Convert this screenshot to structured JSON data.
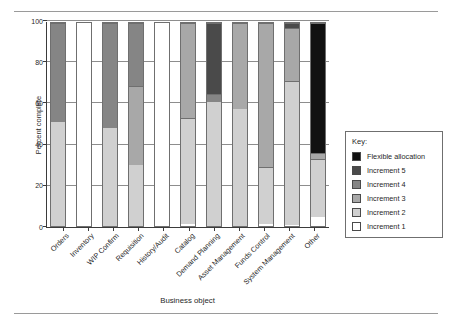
{
  "figure": {
    "top_rule": "",
    "bottom_rule": ""
  },
  "chart_data": {
    "type": "bar",
    "stacked": true,
    "title": "",
    "xlabel": "Business object",
    "ylabel": "Percent complete",
    "ylim": [
      0,
      100
    ],
    "yticks": [
      0,
      20,
      40,
      60,
      80,
      100
    ],
    "grid": true,
    "legend_position": "right",
    "legend_title": "Key:",
    "categories": [
      "Orders",
      "Inventory",
      "WIP Confirm",
      "Requisition",
      "History/Audit",
      "Catalog",
      "Demand Planning",
      "Asset Management",
      "Funds Control",
      "System Management",
      "Other"
    ],
    "series": [
      {
        "name": "Increment 1",
        "color": "#ffffff",
        "values": [
          0,
          100,
          0,
          0,
          100,
          1,
          0,
          0,
          1,
          0.5,
          4.5
        ]
      },
      {
        "name": "Increment 2",
        "color": "#d0d0d0",
        "values": [
          51,
          0,
          48.5,
          30,
          0,
          52,
          61,
          57.5,
          28,
          71,
          28.5
        ]
      },
      {
        "name": "Increment 3",
        "color": "#a8a8a8",
        "values": [
          0,
          0,
          0,
          39,
          0,
          47,
          0,
          42.5,
          71,
          26,
          3
        ]
      },
      {
        "name": "Increment 4",
        "color": "#858585",
        "values": [
          49,
          0,
          51.5,
          31,
          0,
          0,
          4,
          0,
          0,
          0,
          0
        ]
      },
      {
        "name": "Increment 5",
        "color": "#4a4a4a",
        "values": [
          0,
          0,
          0,
          0,
          0,
          0,
          35,
          0,
          0,
          2.5,
          0
        ]
      },
      {
        "name": "Flexible allocation",
        "color": "#111111",
        "values": [
          0,
          0,
          0,
          0,
          0,
          0,
          0,
          0,
          0,
          0,
          64
        ]
      }
    ],
    "legend_order_displayed": [
      "Flexible allocation",
      "Increment 5",
      "Increment 4",
      "Increment 3",
      "Increment 2",
      "Increment 1"
    ]
  }
}
